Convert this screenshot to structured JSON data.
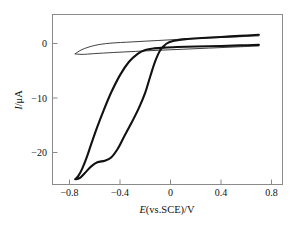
{
  "chart_data": {
    "type": "line",
    "title": "",
    "subtitle": "",
    "xlabel": "E(vs.SCE)/V",
    "xlabel_italic_part": "E",
    "xlabel_rest": "(vs.SCE)/V",
    "ylabel": "I/μA",
    "ylabel_italic_part": "I",
    "ylabel_rest": "/μA",
    "xlim": [
      -0.95,
      0.95
    ],
    "ylim": [
      -27.5,
      3.5
    ],
    "xticks": [
      -0.8,
      -0.4,
      0,
      0.4,
      0.8
    ],
    "xtick_labels": [
      "−0.8",
      "−0.4",
      "0",
      "0.4",
      "0.8"
    ],
    "yticks": [
      0,
      -10,
      -20
    ],
    "ytick_labels": [
      "0",
      "−10",
      "−20"
    ],
    "grid": false,
    "legend": "none",
    "colors": {
      "curve_main": "#111111",
      "curve_background": "#2b2b2b",
      "axis": "#8a8a8a",
      "background": "#ffffff"
    },
    "series": [
      {
        "name": "cyclic-voltammogram-sample",
        "style": "thick",
        "description": "Large cathodic reduction wave with crossover near -0.05 V",
        "points_forward": [
          [
            0.7,
            1.6
          ],
          [
            0.55,
            1.4
          ],
          [
            0.4,
            1.2
          ],
          [
            0.25,
            1.0
          ],
          [
            0.12,
            0.8
          ],
          [
            0.03,
            0.5
          ],
          [
            -0.03,
            0.0
          ],
          [
            -0.08,
            -1.2
          ],
          [
            -0.12,
            -3.2
          ],
          [
            -0.16,
            -6.0
          ],
          [
            -0.2,
            -9.0
          ],
          [
            -0.25,
            -11.8
          ],
          [
            -0.31,
            -14.6
          ],
          [
            -0.37,
            -17.2
          ],
          [
            -0.42,
            -19.4
          ],
          [
            -0.47,
            -20.9
          ],
          [
            -0.52,
            -21.5
          ],
          [
            -0.58,
            -21.8
          ],
          [
            -0.63,
            -22.6
          ],
          [
            -0.68,
            -23.8
          ],
          [
            -0.72,
            -24.7
          ],
          [
            -0.755,
            -24.9
          ]
        ],
        "points_reverse": [
          [
            -0.755,
            -24.9
          ],
          [
            -0.73,
            -24.3
          ],
          [
            -0.7,
            -23.0
          ],
          [
            -0.665,
            -21.0
          ],
          [
            -0.63,
            -18.6
          ],
          [
            -0.58,
            -15.3
          ],
          [
            -0.53,
            -12.3
          ],
          [
            -0.47,
            -9.0
          ],
          [
            -0.4,
            -5.8
          ],
          [
            -0.33,
            -3.4
          ],
          [
            -0.26,
            -1.9
          ],
          [
            -0.2,
            -1.2
          ],
          [
            -0.13,
            -0.9
          ],
          [
            -0.05,
            -0.75
          ],
          [
            0.05,
            -0.65
          ],
          [
            0.2,
            -0.55
          ],
          [
            0.4,
            -0.45
          ],
          [
            0.55,
            -0.35
          ],
          [
            0.7,
            -0.25
          ]
        ]
      },
      {
        "name": "background-electrolyte-cv",
        "style": "thin",
        "description": "Small featureless background loop",
        "points_forward": [
          [
            0.7,
            1.4
          ],
          [
            0.5,
            1.2
          ],
          [
            0.3,
            1.0
          ],
          [
            0.1,
            0.8
          ],
          [
            -0.1,
            0.55
          ],
          [
            -0.3,
            0.3
          ],
          [
            -0.48,
            0.05
          ],
          [
            -0.6,
            -0.35
          ],
          [
            -0.7,
            -1.1
          ],
          [
            -0.755,
            -1.9
          ]
        ],
        "points_reverse": [
          [
            -0.755,
            -1.9
          ],
          [
            -0.7,
            -2.0
          ],
          [
            -0.6,
            -1.85
          ],
          [
            -0.45,
            -1.65
          ],
          [
            -0.28,
            -1.45
          ],
          [
            -0.1,
            -1.25
          ],
          [
            0.1,
            -1.05
          ],
          [
            0.3,
            -0.85
          ],
          [
            0.5,
            -0.65
          ],
          [
            0.7,
            -0.45
          ]
        ]
      }
    ],
    "annotations": []
  }
}
